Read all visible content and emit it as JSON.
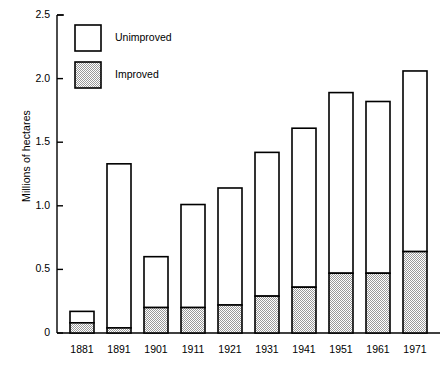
{
  "chart_data": {
    "type": "bar",
    "barmode": "stacked",
    "title": "",
    "subtitle": "",
    "xlabel": "",
    "ylabel": "Millions of hectares",
    "categories": [
      "1881",
      "1891",
      "1901",
      "1911",
      "1921",
      "1931",
      "1941",
      "1951",
      "1961",
      "1971"
    ],
    "series": [
      {
        "name": "Improved",
        "values": [
          0.08,
          0.04,
          0.2,
          0.2,
          0.22,
          0.29,
          0.36,
          0.47,
          0.47,
          0.64
        ]
      },
      {
        "name": "Unimproved",
        "values": [
          0.09,
          1.29,
          0.4,
          0.81,
          0.92,
          1.13,
          1.25,
          1.42,
          1.35,
          1.42
        ]
      }
    ],
    "totals": [
      0.17,
      1.33,
      0.6,
      1.01,
      1.14,
      1.42,
      1.61,
      1.89,
      1.82,
      2.06
    ],
    "ylim": [
      0,
      2.5
    ],
    "ytick_labels": [
      "0",
      "0.5",
      "1.0",
      "1.5",
      "2.0",
      "2.5"
    ],
    "ytick_values": [
      0,
      0.5,
      1.0,
      1.5,
      2.0,
      2.5
    ],
    "grid": false,
    "legend_position": "top-left",
    "legend": [
      {
        "label": "Unimproved",
        "fill": "white"
      },
      {
        "label": "Improved",
        "fill": "hatch-gray"
      }
    ],
    "colors": {
      "axis": "#000000",
      "bar_stroke": "#000000",
      "unimproved_fill": "#ffffff",
      "improved_fill": "#c9c9c9"
    }
  }
}
